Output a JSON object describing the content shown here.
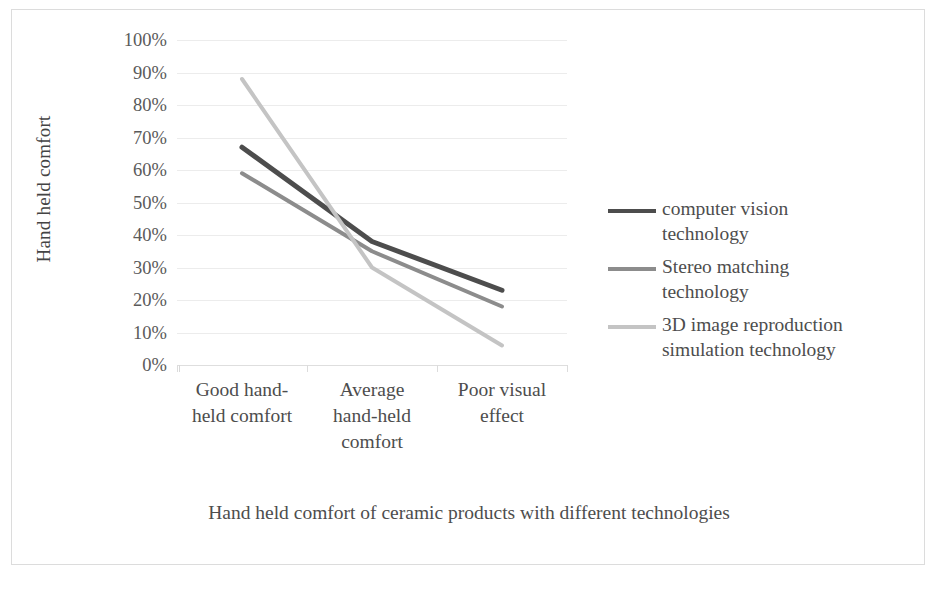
{
  "chart_data": {
    "type": "line",
    "title": "Hand held comfort of ceramic products with different technologies",
    "xlabel": "",
    "ylabel": "Hand held comfort",
    "categories": [
      "Good hand-held comfort",
      "Average hand-held comfort",
      "Poor visual effect"
    ],
    "category_lines": [
      [
        "Good hand-",
        "held comfort"
      ],
      [
        "Average",
        "hand-held",
        "comfort"
      ],
      [
        "Poor visual",
        "effect"
      ]
    ],
    "ylim": [
      0,
      100
    ],
    "ytick_values": [
      100,
      90,
      80,
      70,
      60,
      50,
      40,
      30,
      20,
      10,
      0
    ],
    "ytick_labels": [
      "100%",
      "90%",
      "80%",
      "70%",
      "60%",
      "50%",
      "40%",
      "30%",
      "20%",
      "10%",
      "0%"
    ],
    "grid": true,
    "legend_position": "right",
    "series": [
      {
        "name": "computer vision technology",
        "name_lines": [
          "computer vision",
          "technology"
        ],
        "color": "#4d4d4d",
        "values": [
          67,
          38,
          23
        ]
      },
      {
        "name": "Stereo matching technology",
        "name_lines": [
          "Stereo matching",
          "technology"
        ],
        "color": "#8c8c8c",
        "values": [
          59,
          35,
          18
        ]
      },
      {
        "name": "3D image reproduction simulation technology",
        "name_lines": [
          "3D image reproduction",
          "simulation technology"
        ],
        "color": "#c4c4c4",
        "values": [
          88,
          30,
          6
        ]
      }
    ]
  },
  "colors": {
    "frame_border": "#dcdcdc",
    "gridline": "#ececec",
    "text": "#4d4d4d",
    "tick_text": "#5a5a5a"
  }
}
